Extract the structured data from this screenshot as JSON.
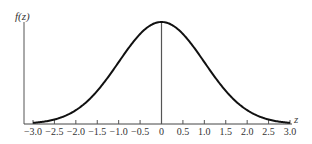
{
  "chart_data": {
    "type": "line",
    "title": "",
    "xlabel": "z",
    "ylabel": "f(z)",
    "x_ticks": [
      -3.0,
      -2.5,
      -2.0,
      -1.5,
      -1.0,
      -0.5,
      0,
      0.5,
      1.0,
      1.5,
      2.0,
      2.5,
      3.0
    ],
    "x_tick_labels": [
      "−3.0",
      "−2.5",
      "−2.0",
      "−1.5",
      "−1.0",
      "−0.5",
      "0",
      "0.5",
      "1.0",
      "1.5",
      "2.0",
      "2.5",
      "3.0"
    ],
    "xlim": [
      -3.0,
      3.0
    ],
    "grid": false,
    "legend": null,
    "series": [
      {
        "name": "standard normal density",
        "function": "f(z) = exp(-z^2/2)/sqrt(2*pi)",
        "x": [
          -3.0,
          -2.5,
          -2.0,
          -1.5,
          -1.0,
          -0.5,
          0,
          0.5,
          1.0,
          1.5,
          2.0,
          2.5,
          3.0
        ],
        "y": [
          0.0044,
          0.0175,
          0.054,
          0.1295,
          0.242,
          0.3521,
          0.3989,
          0.3521,
          0.242,
          0.1295,
          0.054,
          0.0175,
          0.0044
        ]
      }
    ],
    "annotations": [
      "vertical line at z = 0 from baseline to peak"
    ],
    "colors": {
      "curve": "#111111",
      "axes": "#444444",
      "center_line": "#555555"
    }
  }
}
